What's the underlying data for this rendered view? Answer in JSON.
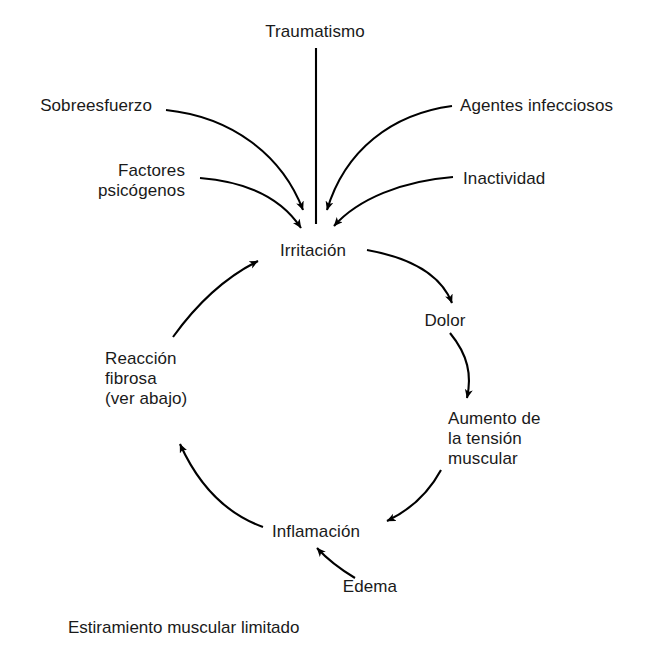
{
  "figure": {
    "type": "cycle-diagram",
    "title_cut_off_fragment": "o  o  o  g o o o o o o ,  o o p o p o o o  o",
    "background_color": "#ffffff",
    "stroke_color": "#000000",
    "text_color": "#1a1a1a"
  },
  "caption": {
    "text": "Estiramiento muscular limitado"
  },
  "inputs": [
    {
      "id": "traumatismo",
      "label": "Traumatismo",
      "x": 315,
      "y": 33,
      "align": "center"
    },
    {
      "id": "sobreesfuerzo",
      "label": "Sobreesfuerzo",
      "x": 152,
      "y": 107,
      "align": "right"
    },
    {
      "id": "agentes-infecciosos",
      "label": "Agentes infecciosos",
      "x": 460,
      "y": 107,
      "align": "left"
    },
    {
      "id": "factores-psicogenos",
      "label": "Factores\npsicógenos",
      "x": 185,
      "y": 172,
      "align": "right"
    },
    {
      "id": "inactividad",
      "label": "Inactividad",
      "x": 463,
      "y": 180,
      "align": "left"
    },
    {
      "id": "edema",
      "label": "Edema",
      "x": 370,
      "y": 588,
      "align": "center"
    }
  ],
  "cycle_nodes": [
    {
      "id": "irritacion",
      "label": "Irritación",
      "x": 313,
      "y": 252,
      "align": "center"
    },
    {
      "id": "dolor",
      "label": "Dolor",
      "x": 445,
      "y": 322,
      "align": "center"
    },
    {
      "id": "aumento-tension-muscular",
      "label": "Aumento de\nla tensión\nmuscular",
      "x": 448,
      "y": 420,
      "align": "left"
    },
    {
      "id": "inflamacion",
      "label": "Inflamación",
      "x": 316,
      "y": 533,
      "align": "center"
    },
    {
      "id": "reaccion-fibrosa",
      "label": "Reacción\nfibrosa\n(ver abajo)",
      "x": 105,
      "y": 360,
      "align": "left"
    }
  ],
  "edges": [
    {
      "from": "traumatismo",
      "to": "irritacion",
      "style": "straight-line",
      "arrowhead": false
    },
    {
      "from": "sobreesfuerzo",
      "to": "irritacion",
      "style": "curve",
      "arrowhead": true
    },
    {
      "from": "factores-psicogenos",
      "to": "irritacion",
      "style": "curve",
      "arrowhead": true
    },
    {
      "from": "agentes-infecciosos",
      "to": "irritacion",
      "style": "curve",
      "arrowhead": true
    },
    {
      "from": "inactividad",
      "to": "irritacion",
      "style": "curve",
      "arrowhead": true
    },
    {
      "from": "irritacion",
      "to": "dolor",
      "style": "arc",
      "arrowhead": true
    },
    {
      "from": "dolor",
      "to": "aumento-tension-muscular",
      "style": "arc",
      "arrowhead": true
    },
    {
      "from": "aumento-tension-muscular",
      "to": "inflamacion",
      "style": "arc",
      "arrowhead": true
    },
    {
      "from": "inflamacion",
      "to": "reaccion-fibrosa",
      "style": "arc",
      "arrowhead": true
    },
    {
      "from": "reaccion-fibrosa",
      "to": "irritacion",
      "style": "arc",
      "arrowhead": true
    },
    {
      "from": "edema",
      "to": "inflamacion",
      "style": "arc",
      "arrowhead": true
    }
  ]
}
